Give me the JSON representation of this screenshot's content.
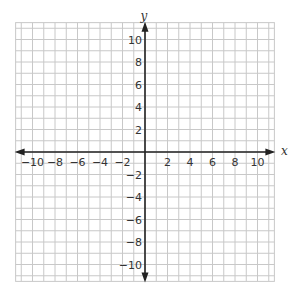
{
  "chart_data": {
    "type": "scatter",
    "title": "",
    "xlabel": "x",
    "ylabel": "y",
    "xlim": [
      -11.5,
      11.5
    ],
    "ylim": [
      -11.5,
      11.5
    ],
    "grid": true,
    "grid_step": 1,
    "x_ticks": [
      -10,
      -8,
      -6,
      -4,
      -2,
      2,
      4,
      6,
      8,
      10
    ],
    "y_ticks": [
      10,
      8,
      6,
      4,
      2,
      -2,
      -4,
      -6,
      -8,
      -10
    ],
    "x_tick_labels": [
      "−10",
      "−8",
      "−6",
      "−4",
      "−2",
      "2",
      "4",
      "6",
      "8",
      "10"
    ],
    "y_tick_labels": [
      "10",
      "8",
      "6",
      "4",
      "2",
      "−2",
      "−4",
      "−6",
      "−8",
      "−10"
    ],
    "series": [],
    "legend": null
  },
  "colors": {
    "grid": "#c8c8c8",
    "axis": "#222222",
    "text": "#333333"
  }
}
